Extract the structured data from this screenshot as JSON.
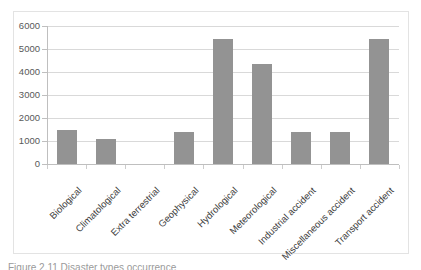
{
  "figure": {
    "caption_fragment": "Figure 2.11  Disaster types occurrence"
  },
  "chart_data": {
    "type": "bar",
    "title": "",
    "subtitle": "",
    "xlabel": "",
    "ylabel": "",
    "categories": [
      "Biological",
      "Climatological",
      "Extra terrestrial",
      "Geophysical",
      "Hydrological",
      "Meteorological",
      "Industrial accident",
      "Miscellaneous accident",
      "Transport accident"
    ],
    "values": [
      1480,
      1090,
      0,
      1390,
      5420,
      4360,
      1400,
      1380,
      5430
    ],
    "ylim": [
      0,
      6000
    ],
    "yticks": [
      0,
      1000,
      2000,
      3000,
      4000,
      5000,
      6000
    ],
    "ytick_labels": [
      "0",
      "1000",
      "2000",
      "3000",
      "4000",
      "5000",
      "6000"
    ],
    "grid": true,
    "grid_axis": "y",
    "legend": false,
    "legend_position": "none",
    "bar_color": "#939393",
    "gridline_color": "#d9d9d9",
    "axis_color": "#bfbfbf",
    "label_color": "#595959",
    "background_color": "#ffffff",
    "frame_color": "#e3e3e3"
  }
}
